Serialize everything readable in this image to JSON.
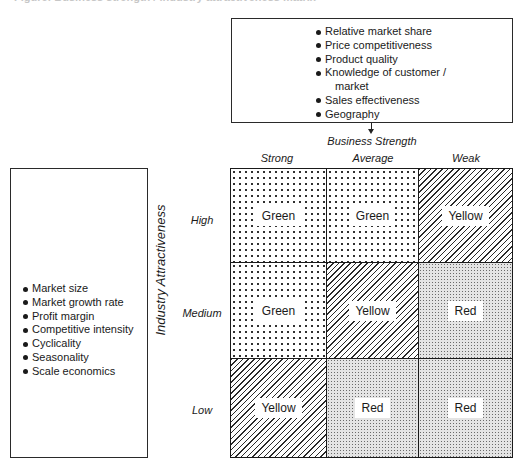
{
  "caption": "Figure: Business strength / industry attractiveness matrix",
  "business_strength_box": {
    "items": [
      "Relative market share",
      "Price competitiveness",
      "Product quality",
      "Knowledge of customer /",
      "Sales effectiveness",
      "Geography"
    ],
    "item_4_continuation": "market"
  },
  "industry_attractiveness_box": {
    "items": [
      "Market size",
      "Market growth rate",
      "Profit margin",
      "Competitive intensity",
      "Cyclicality",
      "Seasonality",
      "Scale economics"
    ]
  },
  "x_axis": {
    "title": "Business Strength",
    "columns": [
      "Strong",
      "Average",
      "Weak"
    ]
  },
  "y_axis": {
    "title": "Industry Attractiveness",
    "rows": [
      "High",
      "Medium",
      "Low"
    ]
  },
  "matrix": {
    "rows": [
      [
        "Green",
        "Green",
        "Yellow"
      ],
      [
        "Green",
        "Yellow",
        "Red"
      ],
      [
        "Yellow",
        "Red",
        "Red"
      ]
    ]
  },
  "patterns": {
    "Green": "sparse-dots",
    "Yellow": "diagonal-hatch",
    "Red": "dense-stipple"
  }
}
